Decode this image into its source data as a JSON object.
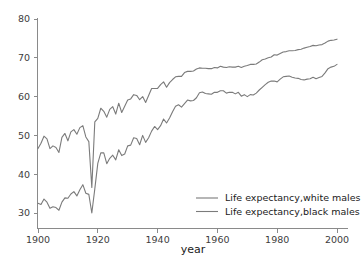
{
  "chart_data": {
    "type": "line",
    "title": "",
    "xlabel": "year",
    "ylabel": "",
    "xlim": [
      1898,
      2001
    ],
    "ylim": [
      28.5,
      81.5
    ],
    "grid": false,
    "legend_position": "bottom-right",
    "xticks": [
      1900,
      1920,
      1940,
      1960,
      1980,
      2000
    ],
    "xtick_labels": [
      "1900",
      "1920",
      "1940",
      "1960",
      "1980",
      "2000"
    ],
    "yticks": [
      30,
      40,
      50,
      60,
      70,
      80
    ],
    "ytick_labels": [
      "30",
      "40",
      "50",
      "60",
      "70",
      "80"
    ],
    "line_color": "#7b7b7b",
    "axis_color": "#8a8a8a",
    "text_color": "#1a1a1a",
    "x": [
      1900,
      1901,
      1902,
      1903,
      1904,
      1905,
      1906,
      1907,
      1908,
      1909,
      1910,
      1911,
      1912,
      1913,
      1914,
      1915,
      1916,
      1917,
      1918,
      1919,
      1920,
      1921,
      1922,
      1923,
      1924,
      1925,
      1926,
      1927,
      1928,
      1929,
      1930,
      1931,
      1932,
      1933,
      1934,
      1935,
      1936,
      1937,
      1938,
      1939,
      1940,
      1941,
      1942,
      1943,
      1944,
      1945,
      1946,
      1947,
      1948,
      1949,
      1950,
      1951,
      1952,
      1953,
      1954,
      1955,
      1956,
      1957,
      1958,
      1959,
      1960,
      1961,
      1962,
      1963,
      1964,
      1965,
      1966,
      1967,
      1968,
      1969,
      1970,
      1971,
      1972,
      1973,
      1974,
      1975,
      1976,
      1977,
      1978,
      1979,
      1980,
      1981,
      1982,
      1983,
      1984,
      1985,
      1986,
      1987,
      1988,
      1989,
      1990,
      1991,
      1992,
      1993,
      1994,
      1995,
      1996,
      1997,
      1998,
      1999,
      2000
    ],
    "series": [
      {
        "name": "Life expectancy,white males",
        "values": [
          46.6,
          48.0,
          49.8,
          49.1,
          46.6,
          47.3,
          46.9,
          45.6,
          49.5,
          50.5,
          48.6,
          50.9,
          51.5,
          50.3,
          52.0,
          52.5,
          49.6,
          48.4,
          36.6,
          53.5,
          54.4,
          57.0,
          56.2,
          54.7,
          56.7,
          57.4,
          55.5,
          58.3,
          55.9,
          57.5,
          59.1,
          59.4,
          60.5,
          60.3,
          59.2,
          60.0,
          58.5,
          60.3,
          62.1,
          62.1,
          62.1,
          63.1,
          63.8,
          62.4,
          63.6,
          64.4,
          65.1,
          65.2,
          65.2,
          66.2,
          66.5,
          66.5,
          66.6,
          67.1,
          67.4,
          67.3,
          67.3,
          67.2,
          67.2,
          67.5,
          67.4,
          67.8,
          67.6,
          67.5,
          67.7,
          67.6,
          67.6,
          67.8,
          67.5,
          67.8,
          68.0,
          68.3,
          68.3,
          68.4,
          68.9,
          69.5,
          69.7,
          70.0,
          70.2,
          70.8,
          70.7,
          71.1,
          71.5,
          71.6,
          71.8,
          71.8,
          71.9,
          72.1,
          72.2,
          72.5,
          72.7,
          72.9,
          73.2,
          73.1,
          73.3,
          73.4,
          73.8,
          74.3,
          74.5,
          74.6,
          74.8
        ]
      },
      {
        "name": "Life expectancy,black males",
        "values": [
          32.5,
          32.2,
          33.6,
          32.8,
          31.2,
          31.6,
          31.4,
          30.7,
          32.8,
          33.9,
          33.8,
          34.9,
          35.5,
          34.4,
          36.0,
          37.3,
          35.1,
          34.8,
          30.0,
          36.2,
          42.8,
          45.5,
          45.5,
          42.7,
          44.1,
          44.9,
          43.7,
          46.3,
          44.8,
          45.2,
          47.3,
          47.5,
          49.4,
          49.2,
          47.6,
          50.0,
          48.2,
          49.4,
          51.1,
          52.3,
          51.5,
          52.5,
          54.2,
          53.2,
          54.5,
          56.1,
          57.5,
          57.9,
          57.3,
          58.2,
          59.1,
          58.9,
          59.0,
          59.7,
          61.0,
          61.2,
          60.8,
          60.7,
          60.6,
          61.1,
          61.1,
          61.5,
          61.5,
          60.9,
          61.1,
          61.1,
          60.7,
          61.1,
          60.1,
          60.5,
          60.0,
          60.5,
          60.4,
          60.9,
          61.7,
          62.4,
          63.1,
          63.7,
          64.0,
          64.0,
          63.8,
          64.5,
          65.1,
          65.2,
          65.3,
          65.0,
          64.8,
          64.7,
          64.4,
          64.3,
          64.5,
          64.6,
          65.0,
          64.6,
          64.9,
          65.2,
          66.1,
          67.2,
          67.6,
          67.8,
          68.3
        ]
      }
    ]
  },
  "legend": {
    "items": [
      {
        "label": "Life expectancy,white males"
      },
      {
        "label": "Life expectancy,black males"
      }
    ]
  },
  "axes": {
    "x_title": "year"
  }
}
